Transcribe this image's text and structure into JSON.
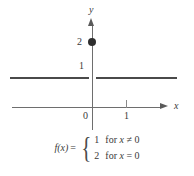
{
  "chart_data": {
    "type": "line",
    "title": "",
    "xlabel": "x",
    "ylabel": "y",
    "xlim": [
      -2.1,
      3.2
    ],
    "ylim": [
      -0.75,
      2.9
    ],
    "grid": false,
    "legend": null,
    "x_ticks": [
      {
        "value": 0,
        "label": "0"
      },
      {
        "value": 1,
        "label": "1"
      }
    ],
    "y_ticks": [
      {
        "value": 1,
        "label": "1"
      },
      {
        "value": 2,
        "label": "2"
      }
    ],
    "origin_label": "0",
    "series": [
      {
        "name": "f(x) = 1 for x != 0",
        "type": "line",
        "segments": [
          {
            "x": [
              -2.1,
              0
            ],
            "y": [
              1,
              1
            ],
            "open_at_right": true
          },
          {
            "x": [
              0,
              3.0
            ],
            "y": [
              1,
              1
            ],
            "open_at_left": true
          }
        ],
        "break_at_x": 0,
        "value": 1
      },
      {
        "name": "f(0) = 2",
        "type": "scatter",
        "points": [
          {
            "x": 0,
            "y": 2,
            "marker": "filled-circle"
          }
        ]
      }
    ]
  },
  "axes": {
    "x_axis_label": "x",
    "y_axis_label": "y",
    "x_tick_1_label": "1",
    "origin_label": "0",
    "y_value_1_label": "1",
    "y_value_2_label": "2",
    "x_arrow_icon": "arrow-right-icon",
    "y_arrow_icon": "arrow-up-icon"
  },
  "formula": {
    "function_name": "f(x)",
    "equals": "=",
    "open_brace": "{",
    "cases": [
      {
        "value": "1",
        "for_word": "for",
        "variable": "x",
        "relation": "≠",
        "rhs": "0"
      },
      {
        "value": "2",
        "for_word": "for",
        "variable": "x",
        "relation": "=",
        "rhs": "0"
      }
    ]
  },
  "colors": {
    "graph_line": "#4a4a4a",
    "axis": "#6e6e6e",
    "point": "#2e2e2e",
    "text": "#3a3a3a",
    "background": "#ffffff"
  }
}
